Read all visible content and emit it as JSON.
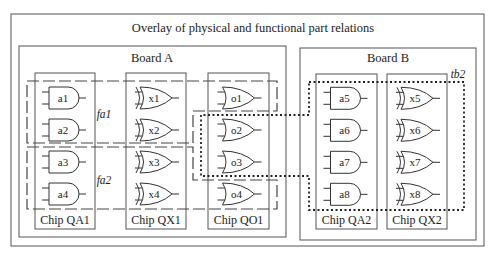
{
  "title": "Overlay of physical and functional part relations",
  "outer": {
    "x": 11,
    "y": 14,
    "w": 473,
    "h": 232
  },
  "boards": [
    {
      "id": "board-a",
      "label": "Board A",
      "x": 19,
      "y": 46,
      "w": 267,
      "h": 191,
      "label_x": 152,
      "label_y": 62
    },
    {
      "id": "board-b",
      "label": "Board B",
      "x": 300,
      "y": 48,
      "w": 176,
      "h": 192,
      "label_x": 388,
      "label_y": 62
    }
  ],
  "chips": [
    {
      "id": "chip-qa1",
      "label": "Chip QA1",
      "x": 35,
      "y": 73,
      "w": 60,
      "h": 156,
      "gate_type": "and",
      "gates": [
        "a1",
        "a2",
        "a3",
        "a4"
      ]
    },
    {
      "id": "chip-qx1",
      "label": "Chip QX1",
      "x": 126,
      "y": 73,
      "w": 60,
      "h": 156,
      "gate_type": "xor",
      "gates": [
        "x1",
        "x2",
        "x3",
        "x4"
      ]
    },
    {
      "id": "chip-qo1",
      "label": "Chip QO1",
      "x": 208,
      "y": 73,
      "w": 61,
      "h": 156,
      "gate_type": "or",
      "gates": [
        "o1",
        "o2",
        "o3",
        "o4"
      ]
    },
    {
      "id": "chip-qa2",
      "label": "Chip QA2",
      "x": 316,
      "y": 74,
      "w": 61,
      "h": 155,
      "gate_type": "and",
      "gates": [
        "a5",
        "a6",
        "a7",
        "a8"
      ]
    },
    {
      "id": "chip-qx2",
      "label": "Chip QX2",
      "x": 387,
      "y": 74,
      "w": 60,
      "h": 155,
      "gate_type": "xor",
      "gates": [
        "x5",
        "x6",
        "x7",
        "x8"
      ]
    }
  ],
  "gate_rows_y": [
    98,
    130,
    162,
    194
  ],
  "functional_groups": [
    {
      "id": "fa1",
      "label": "fa1",
      "label_x": 104,
      "label_y": 118,
      "style": "dashed",
      "points": "27,81 277,81 277,111 193,111 193,143 27,143"
    },
    {
      "id": "fa2",
      "label": "fa2",
      "label_x": 104,
      "label_y": 184,
      "style": "dashed",
      "points": "27,147 193,147 193,180 277,180 277,209 27,209"
    },
    {
      "id": "tb2",
      "label": "tb2",
      "label_x": 458,
      "label_y": 78,
      "style": "dotted",
      "points": "309,82 464,82 464,210 309,210 309,176 201,176 201,115 309,115"
    }
  ]
}
